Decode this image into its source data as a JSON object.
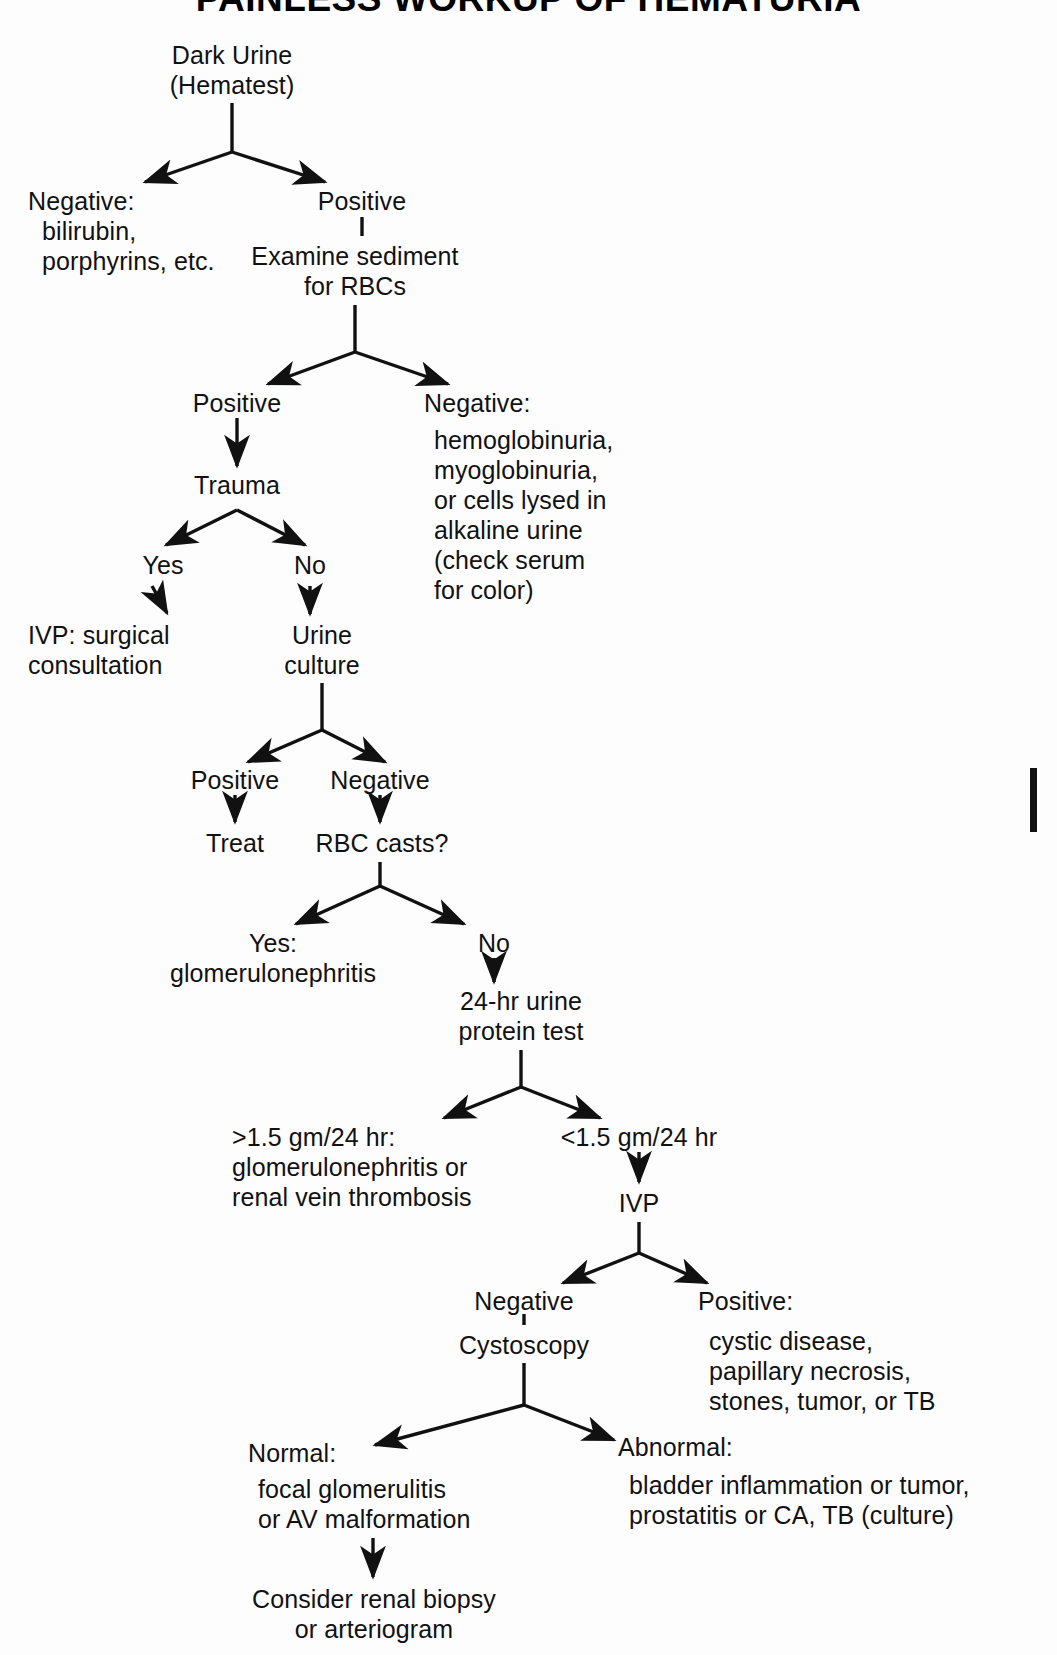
{
  "title": "PAINLESS WORKUP OF HEMATURIA",
  "nodes": {
    "root": "Dark Urine\n(Hematest)",
    "neg_hematest": "Negative:\n  bilirubin,\n  porphyrins, etc.",
    "pos_hematest": "Positive",
    "examine_sediment": "Examine sediment\nfor RBCs",
    "sediment_positive": "Positive",
    "sediment_negative": "Negative:",
    "sediment_negative_detail": "hemoglobinuria,\nmyoglobinuria,\nor cells lysed in\nalkaline urine\n(check serum\nfor color)",
    "trauma": "Trauma",
    "trauma_yes": "Yes",
    "trauma_no": "No",
    "ivp_surgical": "IVP: surgical\nconsultation",
    "urine_culture": "Urine\nculture",
    "culture_positive": "Positive",
    "culture_negative": "Negative",
    "treat": "Treat",
    "rbc_casts": "RBC casts?",
    "casts_yes": "Yes:\nglomerulonephritis",
    "casts_no": "No",
    "protein_test": "24-hr urine\nprotein test",
    "protein_high": ">1.5 gm/24 hr:\nglomerulonephritis or\nrenal vein thrombosis",
    "protein_low": "<1.5 gm/24 hr",
    "ivp": "IVP",
    "ivp_negative": "Negative",
    "cystoscopy": "Cystoscopy",
    "ivp_positive": "Positive:",
    "ivp_positive_detail": "cystic disease,\npapillary necrosis,\nstones, tumor, or TB",
    "cysto_normal": "Normal:",
    "cysto_normal_detail": "focal glomerulitis\nor AV malformation",
    "cysto_abnormal": "Abnormal:",
    "cysto_abnormal_detail": "bladder inflammation or tumor,\nprostatitis or CA, TB (culture)",
    "final": "Consider renal biopsy\nor arteriogram"
  },
  "colors": {
    "ink": "#111111",
    "page": "#fdfdfd"
  }
}
